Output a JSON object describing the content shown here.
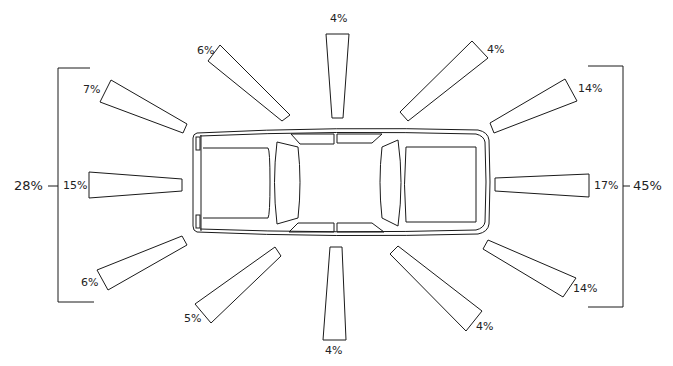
{
  "diagram": {
    "stroke_color": "#1a1a1a",
    "background": "#ffffff"
  },
  "wedges": [
    {
      "position": "front-left",
      "label": "4%"
    },
    {
      "position": "front",
      "label": "17%"
    },
    {
      "position": "front-right",
      "label": "14%"
    }
  ],
  "labels": {
    "top_center": "4%",
    "top_left": "6%",
    "top_right": "4%",
    "left_upper": "7%",
    "left_middle": "15%",
    "left_lower": "6%",
    "right_upper": "14%",
    "right_middle": "17%",
    "right_lower": "14%",
    "bottom_left": "5%",
    "bottom_center": "4%",
    "bottom_right": "4%",
    "left_group_total": "28%",
    "right_group_total": "45%"
  }
}
